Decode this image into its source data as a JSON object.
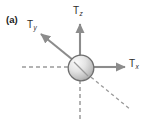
{
  "figure": {
    "panel_label": "(a)",
    "background_color": "#ffffff",
    "width": 149,
    "height": 124
  },
  "sphere": {
    "name": "central-node",
    "center_x": 81,
    "center_y": 68,
    "radius": 13,
    "fill_light": "#f2f2f2",
    "fill_dark": "#adadad",
    "stroke_color": "#6e6e6e"
  },
  "axes": [
    {
      "id": "axis-x-negative",
      "style": "dashed",
      "x1": 22,
      "y1": 67,
      "x2": 68,
      "y2": 67,
      "color": "#9a9a9a"
    },
    {
      "id": "axis-z-negative",
      "style": "dashed",
      "x1": 80,
      "y1": 81,
      "x2": 80,
      "y2": 119,
      "color": "#9a9a9a"
    },
    {
      "id": "axis-y-negative",
      "style": "dashed",
      "x1": 88,
      "y1": 75,
      "x2": 131,
      "y2": 110,
      "color": "#9a9a9a"
    }
  ],
  "vectors": [
    {
      "id": "vector-tz",
      "label": "T",
      "subscript": "z",
      "direction": "up",
      "x1": 80,
      "y1": 55,
      "x2": 80,
      "y2": 22,
      "color": "#8c8c8c"
    },
    {
      "id": "vector-ty",
      "label": "T",
      "subscript": "y",
      "direction": "up-left",
      "x1": 72,
      "y1": 59,
      "x2": 39,
      "y2": 32,
      "color": "#8c8c8c"
    },
    {
      "id": "vector-tx",
      "label": "T",
      "subscript": "x",
      "direction": "right",
      "x1": 95,
      "y1": 67,
      "x2": 127,
      "y2": 67,
      "color": "#8c8c8c"
    }
  ]
}
